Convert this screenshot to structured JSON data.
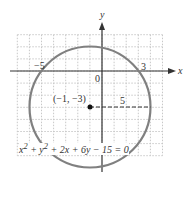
{
  "figure": {
    "x_axis_label": "x",
    "y_axis_label": "y",
    "origin_label": "0",
    "tick_neg5": "−5",
    "tick_3": "3",
    "center_label": "(−1, −3)",
    "radius_label": "5",
    "equation_html": "x<sup>2</sup> + y<sup>2</sup> + 2x + 6y − 15 = 0",
    "equation": "x² + y² + 2x + 6y − 15 = 0",
    "circle_color": "#808080",
    "grid_color": "#c8c8c8",
    "axis_color": "#333333"
  },
  "circle": {
    "center": [
      -1,
      -3
    ],
    "radius": 5
  },
  "grid": {
    "xmin": -7,
    "xmax": 5,
    "ymin": -7,
    "ymax": 3
  }
}
